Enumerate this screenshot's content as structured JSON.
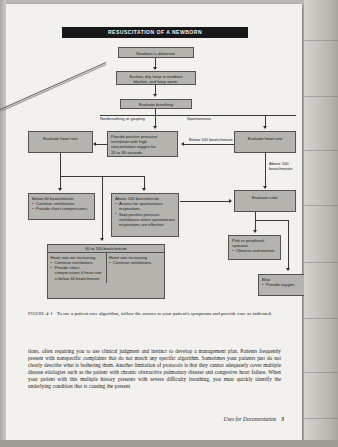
{
  "figure": {
    "title": "RESUSCITATION OF A NEWBORN",
    "nodes": {
      "newborn_delivered": "Newborn is delivered.",
      "suction_dry": [
        "Suction, dry, keep in newborn",
        "blanket, and keep warm."
      ],
      "evaluate_breathing": "Evaluate breathing",
      "evaluate_heart_rate_left": "Evaluate heart rate",
      "ppv": [
        "Provide positive pressure",
        "ventilation with high",
        "concentration oxygen for",
        "15 to 30 seconds"
      ],
      "evaluate_heart_rate_right": "Evaluate heart rate",
      "evaluate_color": "Evaluate color",
      "below60": {
        "header": "Below 60 beats/minute",
        "items": [
          "Continue ventilations.",
          "Provide chest compressions."
        ]
      },
      "above100": {
        "header": "Above 100 beats/minute",
        "items": [
          "Assess for spontaneous respirations.",
          "Stop positive pressure ventilations when spontaneous respirations are effective."
        ]
      },
      "sixty_to_100": {
        "header": "60 to 100 beats/minute",
        "left_title": "Heart rate not increasing",
        "left_items": [
          "Continue ventilations.",
          "Provide chest compressions if heart rate is below 60 beats/minute"
        ],
        "right_title": "Heart rate increasing",
        "right_items": [
          "Continue ventilations."
        ]
      },
      "pink": {
        "header": "Pink or peripheral cyanosis",
        "items": [
          "Observe and monitor."
        ]
      },
      "blue": {
        "header": "Blue",
        "items": [
          "Provide oxygen."
        ]
      }
    },
    "edge_labels": {
      "nonbreathing": "Nonbreathing or gasping",
      "spontaneous": "Spontaneous",
      "below100": "Below 100 beats/minute",
      "above100_line1": "Above 100",
      "above100_line2": "beats/minute"
    }
  },
  "caption": {
    "label": "Figure 4-1",
    "text": "To use a patient care algorithm, follow the arrows to your patient's symptoms and provide care as indicated."
  },
  "body": {
    "paragraph": "tions, often requiring you to use clinical judgment and instinct to develop a management plan. Patients frequently present with nonspecific complaints that do not match any specific algorithm. Sometimes your patients just do not clearly describe what is bothering them. Another limitation of protocols is that they cannot adequately cover multiple disease etiologies such as the patient with chronic obstructive pulmonary disease and congestive heart failure. When your patient with this multiple history presents with severe difficulty breathing, you must quickly identify the underlying condition that is causing the present"
  },
  "footer": {
    "running_title": "Uses for Documentation",
    "page_number": "3"
  }
}
